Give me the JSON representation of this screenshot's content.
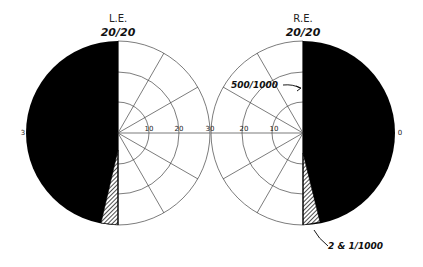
{
  "left_eye": {
    "label": "L.E.",
    "acuity": "20/20",
    "ticks": [
      "10",
      "20",
      "30"
    ],
    "edge_label": "3"
  },
  "right_eye": {
    "label": "R.E.",
    "acuity": "20/20",
    "ticks": [
      "10",
      "20",
      "30"
    ],
    "edge_label": "0"
  },
  "annotations": {
    "upper": "500/1000",
    "lower": "2 & 1/1000"
  },
  "colors": {
    "blind": "#000000",
    "grid": "#444444",
    "background": "#ffffff"
  }
}
